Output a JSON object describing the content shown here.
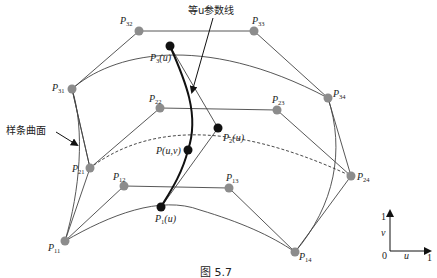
{
  "figure": {
    "caption": "图 5.7",
    "annotations": {
      "iso_u_line": "等u参数线",
      "spline_surface": "样条曲面"
    },
    "colors": {
      "control_point": "#8c8c8c",
      "curve_point": "#111111",
      "line": "#444444",
      "bold_curve": "#111111"
    },
    "control_points": [
      {
        "id": "P11",
        "base": "P",
        "sub": "11",
        "x": 65,
        "y": 241
      },
      {
        "id": "P12",
        "base": "P",
        "sub": "12",
        "x": 124,
        "y": 186
      },
      {
        "id": "P13",
        "base": "P",
        "sub": "13",
        "x": 229,
        "y": 188
      },
      {
        "id": "P14",
        "base": "P",
        "sub": "14",
        "x": 295,
        "y": 252
      },
      {
        "id": "P21",
        "base": "P",
        "sub": "21",
        "x": 90,
        "y": 168
      },
      {
        "id": "P22",
        "base": "P",
        "sub": "22",
        "x": 160,
        "y": 108
      },
      {
        "id": "P23",
        "base": "P",
        "sub": "23",
        "x": 277,
        "y": 110
      },
      {
        "id": "P24",
        "base": "P",
        "sub": "24",
        "x": 351,
        "y": 176
      },
      {
        "id": "P31",
        "base": "P",
        "sub": "31",
        "x": 72,
        "y": 89
      },
      {
        "id": "P32",
        "base": "P",
        "sub": "32",
        "x": 139,
        "y": 31
      },
      {
        "id": "P33",
        "base": "P",
        "sub": "33",
        "x": 254,
        "y": 31
      },
      {
        "id": "P34",
        "base": "P",
        "sub": "34",
        "x": 328,
        "y": 98
      }
    ],
    "curve_points": [
      {
        "id": "P1u",
        "label_base": "P",
        "label_sub": "1",
        "label_arg": "(u)",
        "x": 161,
        "y": 207
      },
      {
        "id": "P2u",
        "label_base": "P",
        "label_sub": "2",
        "label_arg": "(u)",
        "x": 218,
        "y": 128
      },
      {
        "id": "P3u",
        "label_base": "P",
        "label_sub": "3",
        "label_arg": "(u)",
        "x": 170,
        "y": 46
      },
      {
        "id": "Puv",
        "label_base": "P",
        "label_sub": "",
        "label_arg": "(u,v)",
        "x": 188,
        "y": 150
      }
    ],
    "param_axes": {
      "origin_label": "0",
      "u_label": "u",
      "u_max": "1",
      "v_label": "v",
      "v_max": "1"
    }
  }
}
